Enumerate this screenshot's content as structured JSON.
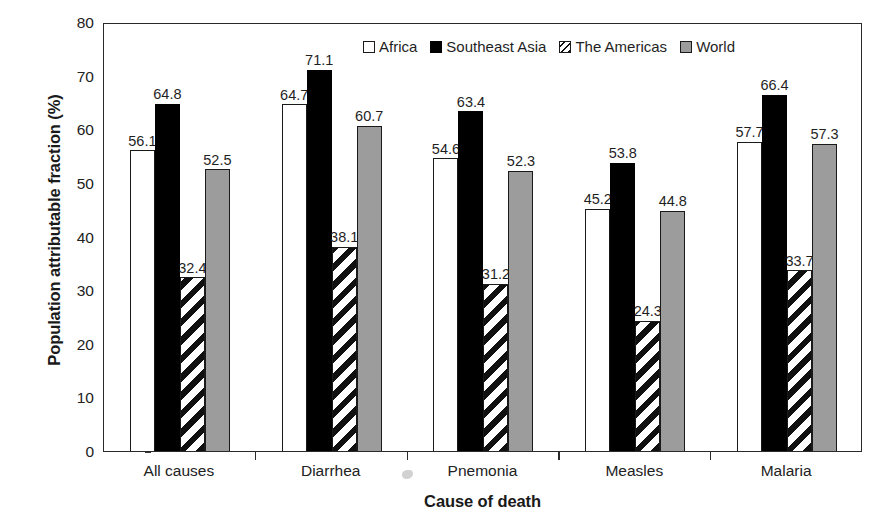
{
  "chart_data": {
    "type": "bar",
    "title": "",
    "xlabel": "Cause of death",
    "ylabel": "Population attributable fraction (%)",
    "ylim": [
      0,
      80
    ],
    "ytick_step": 10,
    "yticks": [
      "0",
      "10",
      "20",
      "30",
      "40",
      "50",
      "60",
      "70",
      "80"
    ],
    "grid": false,
    "legend_position": "top-center",
    "categories": [
      "All causes",
      "Diarrhea",
      "Pnemonia",
      "Measles",
      "Malaria"
    ],
    "series": [
      {
        "name": "Africa",
        "style": "white-outline",
        "color": "#ffffff",
        "values": [
          56.1,
          64.7,
          54.6,
          45.2,
          57.7
        ],
        "labels": [
          "56.1",
          "64.7",
          "54.6",
          "45.2",
          "57.7"
        ]
      },
      {
        "name": "Southeast Asia",
        "style": "solid-black",
        "color": "#000000",
        "values": [
          64.8,
          71.1,
          63.4,
          53.8,
          66.4
        ],
        "labels": [
          "64.8",
          "71.1",
          "63.4",
          "53.8",
          "66.4"
        ]
      },
      {
        "name": "The Americas",
        "style": "diagonal-hatch",
        "color": "#ffffff",
        "values": [
          32.4,
          38.1,
          31.2,
          24.3,
          33.7
        ],
        "labels": [
          "32.4",
          "38.1",
          "31.2",
          "24.3",
          "33.7"
        ]
      },
      {
        "name": "World",
        "style": "solid-gray",
        "color": "#9c9c9c",
        "values": [
          52.5,
          60.7,
          52.3,
          44.8,
          57.3
        ],
        "labels": [
          "52.5",
          "60.7",
          "52.3",
          "44.8",
          "57.3"
        ]
      }
    ]
  },
  "legend": {
    "items": [
      {
        "label": "Africa",
        "swatch": "white-outline"
      },
      {
        "label": "Southeast Asia",
        "swatch": "solid-black"
      },
      {
        "label": "The Americas",
        "swatch": "diagonal-hatch"
      },
      {
        "label": "World",
        "swatch": "solid-gray"
      }
    ]
  },
  "axes": {
    "y_title": "Population attributable fraction (%)",
    "x_title": "Cause of death"
  }
}
